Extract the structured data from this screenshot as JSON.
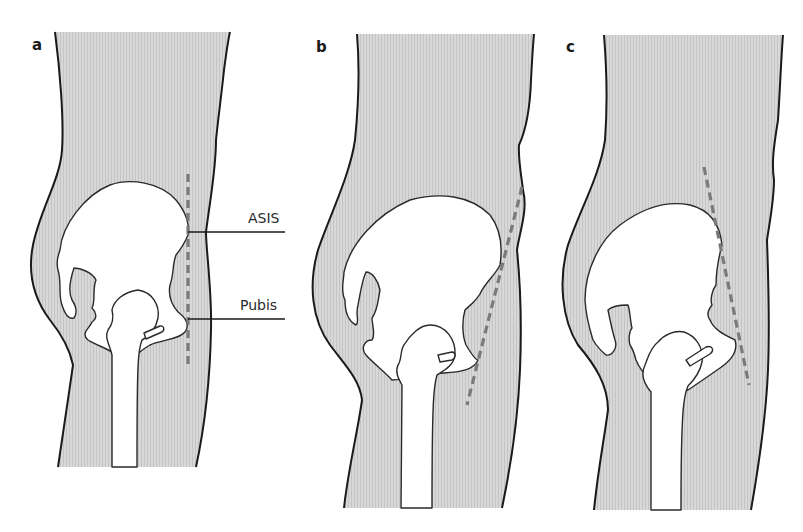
{
  "figure": {
    "panels": [
      {
        "label": "a",
        "description": "lateral view, vertical dashed line through ASIS and pubis"
      },
      {
        "label": "b",
        "description": "lateral view, dashed line tilted (posterior pelvic tilt)"
      },
      {
        "label": "c",
        "description": "lateral view, dashed line tilted (anterior pelvic tilt)"
      }
    ],
    "annotations": [
      {
        "text": "ASIS",
        "panel": "a"
      },
      {
        "text": "Pubis",
        "panel": "a"
      }
    ],
    "colors": {
      "body_fill": "#d4d4d4",
      "stripe": "#c6c6c6",
      "outline": "#1a1a1a",
      "dashed_line": "#7a7a7a",
      "bone_fill": "#ffffff"
    }
  }
}
